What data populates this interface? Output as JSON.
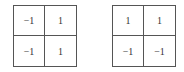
{
  "matrices": [
    {
      "name": "left-matrix",
      "cells": [
        [
          "−1",
          "1"
        ],
        [
          "−1",
          "1"
        ]
      ]
    },
    {
      "name": "right-matrix",
      "cells": [
        [
          "1",
          "1"
        ],
        [
          "−1",
          "−1"
        ]
      ]
    }
  ],
  "colors": {
    "border": "#555555",
    "text": "#333333",
    "background": "#ffffff"
  }
}
